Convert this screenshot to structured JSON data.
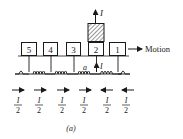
{
  "figure": {
    "caption": "(a)",
    "motion_label": "Motion",
    "top_current_label": "I",
    "feed_current_label": "I",
    "feed_point_label": "a",
    "segments": [
      {
        "id": "5",
        "label": "5",
        "x": 21,
        "w": 15,
        "energized": false
      },
      {
        "id": "4",
        "label": "4",
        "x": 43,
        "w": 14,
        "energized": false
      },
      {
        "id": "3",
        "label": "3",
        "x": 66,
        "w": 14,
        "energized": false
      },
      {
        "id": "2",
        "label": "2",
        "x": 88,
        "w": 16,
        "energized": true
      },
      {
        "id": "1",
        "label": "1",
        "x": 109,
        "w": 16,
        "energized": false
      }
    ],
    "winding_currents": [
      {
        "numerator": "I",
        "denominator": "2",
        "direction": "right",
        "x": 18
      },
      {
        "numerator": "I",
        "denominator": "2",
        "direction": "right",
        "x": 39
      },
      {
        "numerator": "I",
        "denominator": "2",
        "direction": "right",
        "x": 62
      },
      {
        "numerator": "I",
        "denominator": "2",
        "direction": "right",
        "x": 84
      },
      {
        "numerator": "I",
        "denominator": "2",
        "direction": "left",
        "x": 107
      },
      {
        "numerator": "I",
        "denominator": "2",
        "direction": "left",
        "x": 126
      }
    ]
  }
}
